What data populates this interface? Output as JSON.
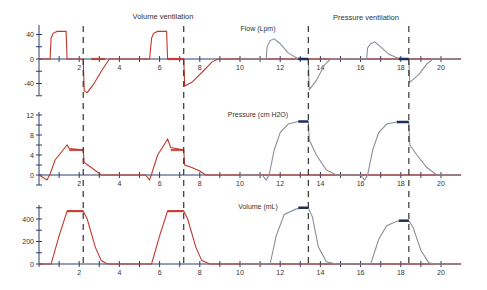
{
  "chart_data": {
    "type": "line",
    "titles": {
      "left": "Volume ventilation",
      "right": "Pressure ventilation"
    },
    "xlabel": "",
    "x_ticks": [
      2,
      4,
      6,
      8,
      10,
      12,
      14,
      16,
      18,
      20
    ],
    "xlim": [
      0,
      21
    ],
    "grid": false,
    "dashed_markers_x": [
      2.2,
      7.2,
      13.4,
      18.4
    ],
    "colors": {
      "volume_ventilation": "#c0392b",
      "pressure_ventilation": "#8a8f98",
      "axis": "#2c3e6b",
      "hold_marker": "#1f2f5a"
    },
    "panels": [
      {
        "name": "flow",
        "label": "Flow (Lpm)",
        "y_ticks": [
          40,
          0,
          -40
        ],
        "ylim": [
          -60,
          50
        ],
        "series": [
          {
            "name": "Volume ventilation",
            "points": [
              [
                0,
                0
              ],
              [
                1.2,
                0
              ],
              [
                1.3,
                36
              ],
              [
                1.5,
                44
              ],
              [
                2.0,
                45
              ],
              [
                2.6,
                45
              ],
              [
                2.7,
                0
              ],
              [
                4.4,
                0
              ],
              [
                4.4,
                0
              ],
              [
                4.4,
                0
              ]
            ]
          }
        ]
      },
      {
        "name": "pressure",
        "label": "Pressure (cm H2O)",
        "y_ticks": [
          12,
          8,
          4,
          0
        ],
        "ylim": [
          -2,
          13
        ]
      },
      {
        "name": "volume",
        "label": "Volume (mL)",
        "y_ticks": [
          400,
          200,
          0
        ],
        "ylim": [
          -20,
          520
        ]
      }
    ],
    "series": [
      {
        "name": "Flow - Volume ventilation",
        "panel": "flow",
        "points": [
          [
            0,
            0
          ],
          [
            1.2,
            0
          ],
          [
            1.3,
            36
          ],
          [
            1.5,
            44
          ],
          [
            2.0,
            45
          ],
          [
            2.6,
            45
          ],
          [
            2.7,
            0
          ],
          [
            3.3,
            0
          ],
          [
            3.35,
            -50
          ],
          [
            3.5,
            -55
          ],
          [
            4.0,
            -40
          ],
          [
            4.8,
            -20
          ],
          [
            5.3,
            0
          ],
          [
            8,
            0
          ],
          [
            8.2,
            36
          ],
          [
            8.5,
            44
          ],
          [
            9,
            45
          ],
          [
            9.6,
            45
          ],
          [
            9.7,
            0
          ],
          [
            10.1,
            0
          ],
          [
            10.15,
            -42
          ],
          [
            10.5,
            -38
          ],
          [
            11,
            -25
          ],
          [
            11.6,
            -5
          ],
          [
            12,
            0
          ]
        ]
      }
    ],
    "volume_ventilation": {
      "flow": [
        [
          0,
          0
        ],
        [
          0.55,
          0
        ],
        [
          0.6,
          34
        ],
        [
          0.7,
          42
        ],
        [
          0.9,
          45
        ],
        [
          1.35,
          45
        ],
        [
          1.4,
          0
        ],
        [
          2.2,
          0
        ],
        [
          2.25,
          -52
        ],
        [
          2.4,
          -55
        ],
        [
          2.7,
          -42
        ],
        [
          3.1,
          -20
        ],
        [
          3.5,
          0
        ],
        [
          5.5,
          0
        ],
        [
          5.6,
          34
        ],
        [
          5.7,
          42
        ],
        [
          5.9,
          45
        ],
        [
          6.35,
          45
        ],
        [
          6.4,
          0
        ],
        [
          7.2,
          0
        ],
        [
          7.25,
          -44
        ],
        [
          7.6,
          -38
        ],
        [
          8.1,
          -22
        ],
        [
          8.6,
          -5
        ],
        [
          8.9,
          0
        ],
        [
          21,
          0
        ]
      ],
      "pressure": [
        [
          0,
          0
        ],
        [
          0.4,
          -1
        ],
        [
          0.55,
          0.2
        ],
        [
          0.8,
          3
        ],
        [
          1.2,
          5
        ],
        [
          1.4,
          6
        ],
        [
          1.5,
          5.3
        ],
        [
          2.2,
          5
        ],
        [
          2.25,
          2.5
        ],
        [
          2.6,
          1.5
        ],
        [
          3.0,
          0.3
        ],
        [
          3.1,
          0
        ],
        [
          5.3,
          0
        ],
        [
          5.5,
          -1
        ],
        [
          5.6,
          0.2
        ],
        [
          5.9,
          4
        ],
        [
          6.3,
          6.5
        ],
        [
          6.4,
          7.2
        ],
        [
          6.55,
          5.5
        ],
        [
          7.2,
          5
        ],
        [
          7.25,
          2
        ],
        [
          7.6,
          1.5
        ],
        [
          8.0,
          0.8
        ],
        [
          8.3,
          0
        ],
        [
          21,
          0
        ]
      ],
      "volume": [
        [
          0,
          0
        ],
        [
          0.6,
          0
        ],
        [
          1.0,
          250
        ],
        [
          1.4,
          470
        ],
        [
          2.2,
          470
        ],
        [
          2.4,
          400
        ],
        [
          2.8,
          150
        ],
        [
          3.1,
          30
        ],
        [
          3.4,
          0
        ],
        [
          5.6,
          0
        ],
        [
          6.0,
          250
        ],
        [
          6.4,
          470
        ],
        [
          7.2,
          470
        ],
        [
          7.4,
          400
        ],
        [
          7.8,
          150
        ],
        [
          8.1,
          30
        ],
        [
          8.5,
          0
        ],
        [
          21,
          0
        ]
      ]
    },
    "pressure_ventilation": {
      "flow": [
        [
          10,
          0
        ],
        [
          11.3,
          0
        ],
        [
          11.35,
          20
        ],
        [
          11.5,
          30
        ],
        [
          11.7,
          33
        ],
        [
          12.0,
          25
        ],
        [
          12.4,
          10
        ],
        [
          12.8,
          2
        ],
        [
          13.4,
          0
        ],
        [
          13.45,
          -50
        ],
        [
          13.8,
          -35
        ],
        [
          14.2,
          -10
        ],
        [
          14.5,
          0
        ],
        [
          16.3,
          0
        ],
        [
          16.35,
          18
        ],
        [
          16.5,
          25
        ],
        [
          16.7,
          28
        ],
        [
          17.0,
          20
        ],
        [
          17.4,
          8
        ],
        [
          17.8,
          2
        ],
        [
          18.4,
          0
        ],
        [
          18.45,
          -38
        ],
        [
          18.9,
          -25
        ],
        [
          19.3,
          -8
        ],
        [
          19.6,
          0
        ],
        [
          21,
          0
        ]
      ],
      "pressure": [
        [
          10,
          0
        ],
        [
          11.1,
          0
        ],
        [
          11.3,
          -1
        ],
        [
          11.45,
          0
        ],
        [
          11.7,
          5
        ],
        [
          12.0,
          8.5
        ],
        [
          12.4,
          10.2
        ],
        [
          12.9,
          10.7
        ],
        [
          13.4,
          10.7
        ],
        [
          13.45,
          7
        ],
        [
          13.8,
          4
        ],
        [
          14.3,
          1
        ],
        [
          14.8,
          0
        ],
        [
          16.0,
          0
        ],
        [
          16.2,
          -1
        ],
        [
          16.35,
          0
        ],
        [
          16.6,
          5
        ],
        [
          16.9,
          8.5
        ],
        [
          17.3,
          10.2
        ],
        [
          17.8,
          10.6
        ],
        [
          18.4,
          10.6
        ],
        [
          18.45,
          6
        ],
        [
          18.8,
          4
        ],
        [
          19.3,
          1.5
        ],
        [
          19.8,
          0
        ],
        [
          21,
          0
        ]
      ],
      "volume": [
        [
          10,
          0
        ],
        [
          11.5,
          0
        ],
        [
          11.8,
          250
        ],
        [
          12.2,
          440
        ],
        [
          12.8,
          490
        ],
        [
          13.4,
          500
        ],
        [
          13.6,
          420
        ],
        [
          13.9,
          150
        ],
        [
          14.3,
          20
        ],
        [
          14.8,
          0
        ],
        [
          16.5,
          0
        ],
        [
          16.9,
          220
        ],
        [
          17.3,
          340
        ],
        [
          17.8,
          380
        ],
        [
          18.4,
          385
        ],
        [
          18.6,
          330
        ],
        [
          19.0,
          120
        ],
        [
          19.4,
          10
        ],
        [
          19.7,
          0
        ],
        [
          21,
          0
        ]
      ]
    }
  }
}
